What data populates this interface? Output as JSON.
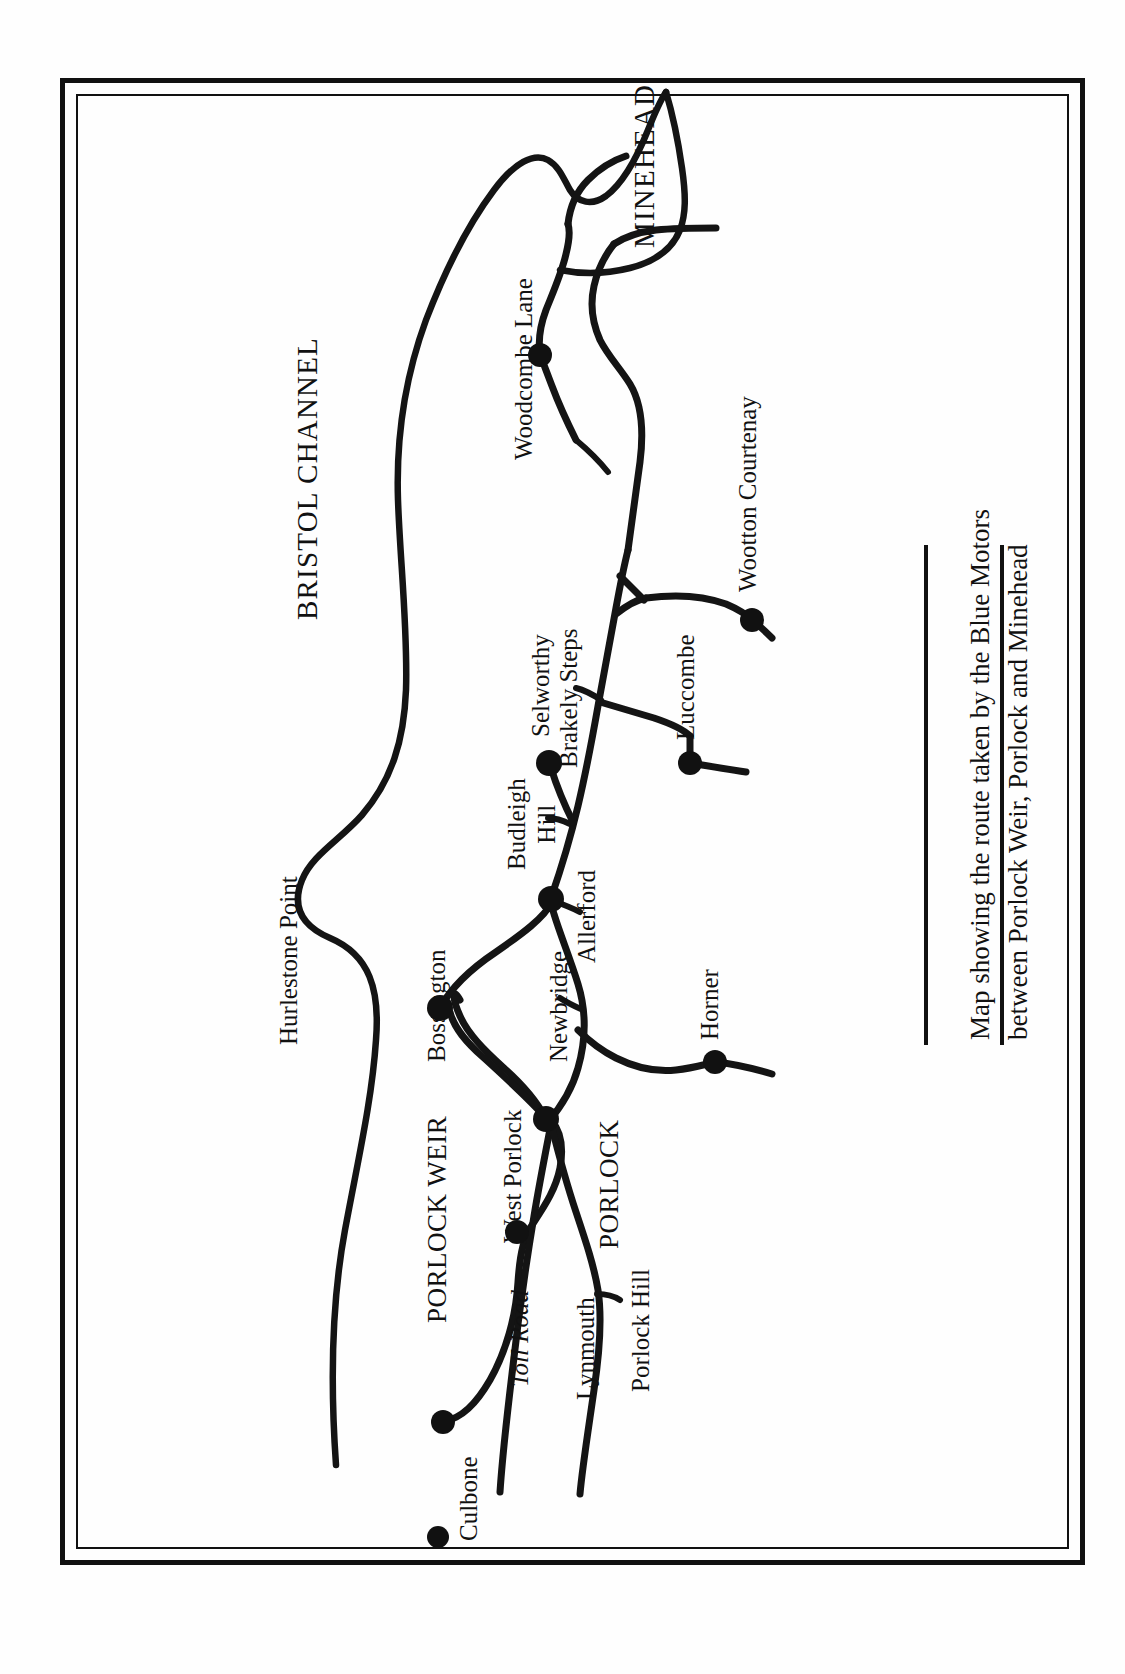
{
  "figure": {
    "kind": "printed-map",
    "orientation": "text rotated 90 degrees counter-clockwise (landscape map on portrait page)",
    "caption_lines": [
      "Map showing the route taken by the Blue Motors",
      "between Porlock Weir, Porlock and Minehead"
    ],
    "ink_color": "#141414",
    "paper_color": "#fefefe"
  },
  "map": {
    "region_labels": [
      {
        "id": "bristol-channel",
        "text": "BRISTOL CHANNEL",
        "style": "caps-large"
      },
      {
        "id": "hurlestone-point",
        "text": "Hurlestone Point",
        "style": "place"
      }
    ],
    "towns": [
      {
        "id": "minehead",
        "text": "MINEHEAD",
        "style": "caps-large",
        "has_dot": false
      },
      {
        "id": "porlock",
        "text": "PORLOCK",
        "style": "caps",
        "has_dot": true
      },
      {
        "id": "porlock-weir",
        "text": "PORLOCK WEIR",
        "style": "caps",
        "has_dot": true
      },
      {
        "id": "culbone",
        "text": "Culbone",
        "style": "place",
        "has_dot": true
      },
      {
        "id": "west-porlock",
        "text": "West Porlock",
        "style": "place",
        "has_dot": true
      },
      {
        "id": "bossington",
        "text": "Bossington",
        "style": "place",
        "has_dot": true
      },
      {
        "id": "allerford",
        "text": "Allerford",
        "style": "place",
        "has_dot": true
      },
      {
        "id": "selworthy",
        "text": "Selworthy",
        "style": "place",
        "has_dot": true
      },
      {
        "id": "luccombe",
        "text": "Luccombe",
        "style": "place",
        "has_dot": true
      },
      {
        "id": "horner",
        "text": "Horner",
        "style": "place",
        "has_dot": true
      },
      {
        "id": "wootton-courtenay",
        "text": "Wootton Courtenay",
        "style": "place",
        "has_dot": true
      },
      {
        "id": "woodcombe-lane",
        "text": "Woodcombe Lane",
        "style": "place",
        "has_dot": true
      }
    ],
    "road_labels": [
      {
        "id": "toll-road",
        "text": "Toll Road",
        "style": "italic"
      },
      {
        "id": "lynmouth",
        "text": "Lynmouth",
        "style": "place"
      },
      {
        "id": "porlock-hill",
        "text": "Porlock Hill",
        "style": "place"
      },
      {
        "id": "newbridge",
        "text": "Newbridge",
        "style": "place"
      },
      {
        "id": "budleigh-hill",
        "text": "Budleigh Hill",
        "style": "place",
        "lines": [
          "Budleigh",
          "Hill"
        ]
      },
      {
        "id": "brakely-steps",
        "text": "Brakely Steps",
        "style": "place"
      }
    ]
  }
}
